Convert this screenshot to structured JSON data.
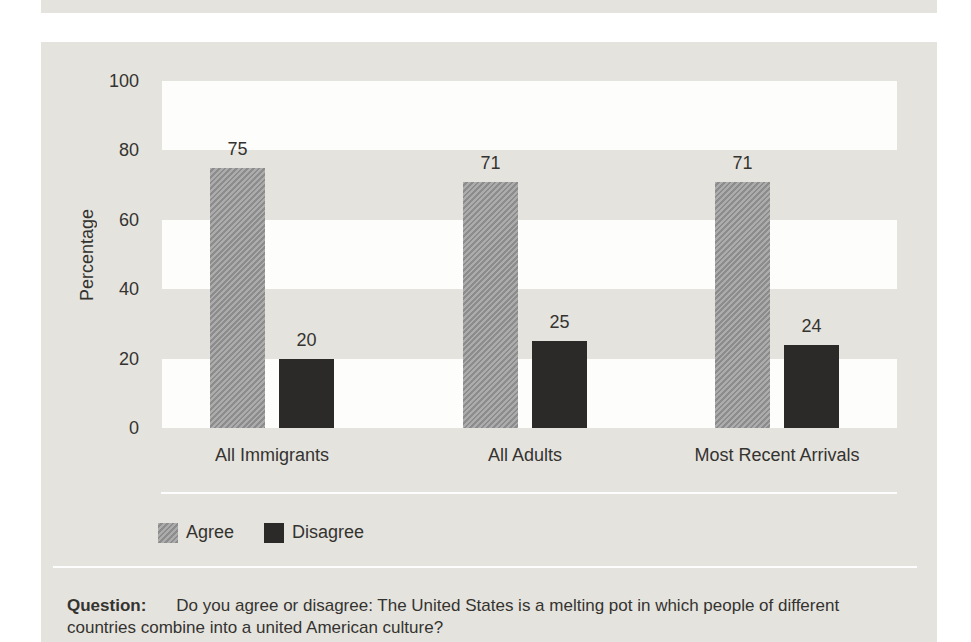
{
  "colors": {
    "page_background": "#ffffff",
    "panel_background": "#e5e3de",
    "band_white": "#fdfdfc",
    "agree_bar": "#9c9c9c",
    "disagree_bar": "#2b2a28",
    "text": "#343330"
  },
  "chart_data": {
    "type": "bar",
    "categories": [
      "All Immigrants",
      "All Adults",
      "Most Recent Arrivals"
    ],
    "series": [
      {
        "name": "Agree",
        "values": [
          75,
          71,
          71
        ],
        "color": "#9c9c9c"
      },
      {
        "name": "Disagree",
        "values": [
          20,
          25,
          24
        ],
        "color": "#2b2a28"
      }
    ],
    "ylabel": "Percentage",
    "ylim": [
      0,
      100
    ],
    "yticks": [
      0,
      20,
      40,
      60,
      80,
      100
    ],
    "grid": "alternating horizontal background bands",
    "legend_position": "bottom-left",
    "value_labels_shown": true
  },
  "question": {
    "label": "Question:",
    "line1": "Do you agree or disagree: The United States is a melting pot in which people of different",
    "line2": "countries combine into a united American culture?"
  }
}
